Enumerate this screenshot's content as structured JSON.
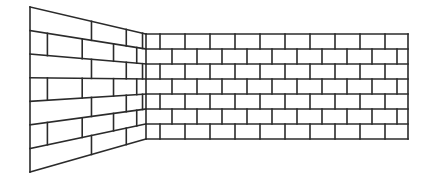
{
  "figure": {
    "stroke_color": "#2b2b2b",
    "background": "#ffffff"
  },
  "left_wall": {
    "outer_top": [
      30,
      7
    ],
    "outer_bottom": [
      30,
      172
    ],
    "inner_top": [
      146,
      34
    ],
    "inner_bottom": [
      146,
      139
    ],
    "rows": 7,
    "joints_t": [
      [
        0.53,
        0.83,
        0.97
      ],
      [
        0.15,
        0.45,
        0.72,
        0.92
      ],
      [
        0.53,
        0.83,
        0.97
      ],
      [
        0.15,
        0.45,
        0.72,
        0.92
      ],
      [
        0.53,
        0.83,
        0.97
      ],
      [
        0.15,
        0.45,
        0.72,
        0.92
      ],
      [
        0.53,
        0.83
      ]
    ]
  },
  "right_wall": {
    "x0": 146,
    "x1": 408,
    "y0": 34,
    "y1": 139,
    "rows": 7,
    "brick_width": 25,
    "odd_row_start": 160,
    "even_row_start": 172
  }
}
